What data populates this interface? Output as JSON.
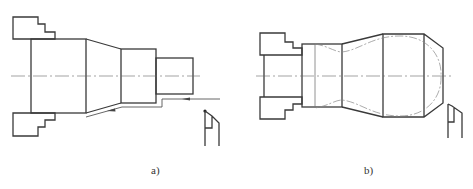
{
  "figure": {
    "panels": [
      {
        "id": "a",
        "label": "a)",
        "description": "Stepped shaft held in chuck jaws, with tool path moving along stepped profile (straight turning)",
        "parts": [
          "chuck-jaw-upper",
          "chuck-jaw-lower",
          "large-cylinder",
          "taper-section",
          "middle-cylinder",
          "small-cylinder",
          "centerline",
          "tool-path-arrow",
          "turning-tool"
        ]
      },
      {
        "id": "b",
        "label": "b)",
        "description": "Curved profile workpiece (handle shape) held in chuck jaws, with dash-dot curved finishing profile and turning tool",
        "parts": [
          "chuck-jaw-upper",
          "chuck-jaw-lower",
          "neck-cylinder",
          "flared-section",
          "ball-section",
          "chamfer",
          "curved-profile",
          "centerline",
          "turning-tool"
        ]
      }
    ],
    "colors": {
      "line": "#3a3a3a",
      "thin_line": "#777777",
      "background": "#ffffff"
    }
  }
}
